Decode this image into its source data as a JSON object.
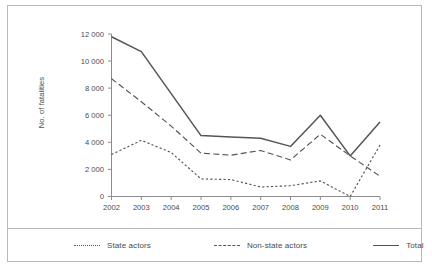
{
  "chart_data": {
    "type": "line",
    "title": "",
    "xlabel": "",
    "ylabel": "No. of fatalities",
    "categories": [
      "2002",
      "2003",
      "2004",
      "2005",
      "2006",
      "2007",
      "2008",
      "2009",
      "2010",
      "2011"
    ],
    "x": [
      2002,
      2003,
      2004,
      2005,
      2006,
      2007,
      2008,
      2009,
      2010,
      2011
    ],
    "ylim": [
      0,
      12000
    ],
    "xlim": [
      2002,
      2011
    ],
    "grid": false,
    "legend_position": "bottom",
    "ytick_labels": [
      "0",
      "2 000",
      "4 000",
      "6 000",
      "8 000",
      "10 000",
      "12 000"
    ],
    "ytick_values": [
      0,
      2000,
      4000,
      6000,
      8000,
      10000,
      12000
    ],
    "series": [
      {
        "name": "State actors",
        "style": "dotted",
        "color": "#555555",
        "values": [
          3100,
          4150,
          3250,
          1300,
          1250,
          700,
          800,
          1150,
          0,
          3800
        ]
      },
      {
        "name": "Non-state actors",
        "style": "dashed",
        "color": "#555555",
        "values": [
          8700,
          7000,
          5200,
          3200,
          3050,
          3400,
          2700,
          4600,
          3000,
          1500
        ]
      },
      {
        "name": "Total",
        "style": "solid",
        "color": "#555555",
        "values": [
          11800,
          10700,
          7600,
          4500,
          4400,
          4300,
          3700,
          6000,
          3000,
          5500
        ]
      }
    ]
  },
  "legend": {
    "items": [
      {
        "label": "State actors",
        "style": "dotted"
      },
      {
        "label": "Non-state actors",
        "style": "dashed"
      },
      {
        "label": "Total",
        "style": "solid"
      }
    ]
  },
  "axis": {
    "y_title": "No. of fatalities"
  }
}
